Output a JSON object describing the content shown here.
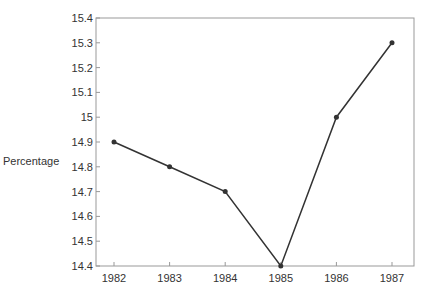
{
  "chart_data": {
    "type": "line",
    "title": "",
    "xlabel": "",
    "ylabel": "Percentage",
    "categories": [
      "1982",
      "1983",
      "1984",
      "1985",
      "1986",
      "1987"
    ],
    "series": [
      {
        "name": "Percentage",
        "values": [
          14.9,
          14.8,
          14.7,
          14.4,
          15.0,
          15.3
        ]
      }
    ],
    "ylim": [
      14.4,
      15.4
    ],
    "yticks": [
      "14.4",
      "14.5",
      "14.6",
      "14.7",
      "14.8",
      "14.9",
      "15",
      "15.1",
      "15.2",
      "15.3",
      "15.4"
    ],
    "grid": false,
    "legend": "none",
    "colors": {
      "line": "#333333",
      "axis": "#999999"
    }
  }
}
